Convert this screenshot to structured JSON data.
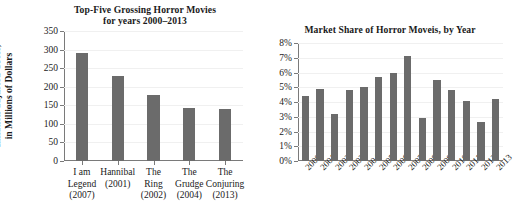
{
  "figure": {
    "background": "#ffffff",
    "bar_color": "#6b6b6b",
    "axis_color": "#7a7a7a",
    "grid_color": "#f0f0f0"
  },
  "chart_data": [
    {
      "type": "bar",
      "id": "top-five-grossing-horror-movies",
      "title": "Top-Five Grossing Horror Movies",
      "subtitle": "for years 2000–2013",
      "xlabel": "",
      "ylabel": "Inflation-adjusted Gross,",
      "ylabel_line2": "in Millions of Dollars",
      "categories": [
        "I am Legend (2007)",
        "Hannibal (2001)",
        "The Ring (2002)",
        "The Grudge (2004)",
        "The Conjuring (2013)"
      ],
      "category_lines": [
        [
          "I am",
          "Legend",
          "(2007)"
        ],
        [
          "Hannibal",
          "(2001)"
        ],
        [
          "The",
          "Ring",
          "(2002)"
        ],
        [
          "The",
          "Grudge",
          "(2004)"
        ],
        [
          "The",
          "Conjuring",
          "(2013)"
        ]
      ],
      "values": [
        291,
        228,
        177,
        143,
        139
      ],
      "ylim": [
        0,
        350
      ],
      "yticks": [
        0,
        50,
        100,
        150,
        200,
        250,
        300,
        350
      ],
      "ytick_labels": [
        "0",
        "50",
        "100",
        "150",
        "200",
        "250",
        "300",
        "350"
      ],
      "grid": true,
      "legend": "none"
    },
    {
      "type": "bar",
      "id": "market-share-of-horror-movies-by-year",
      "title": "Market Share of Horror Moveis, by Year",
      "subtitle": "",
      "xlabel": "",
      "ylabel": "",
      "categories": [
        "2000",
        "2001",
        "2002",
        "2003",
        "2004",
        "2005",
        "2006",
        "2007",
        "2008",
        "2009",
        "2010",
        "2011",
        "2012",
        "2013"
      ],
      "values": [
        4.4,
        4.85,
        3.2,
        4.8,
        5.05,
        5.7,
        6.0,
        7.15,
        2.95,
        5.5,
        4.8,
        4.05,
        2.65,
        4.2
      ],
      "ylim": [
        0,
        8
      ],
      "yticks": [
        0,
        1,
        2,
        3,
        4,
        5,
        6,
        7,
        8
      ],
      "ytick_labels": [
        "0%",
        "1%",
        "2%",
        "3%",
        "4%",
        "5%",
        "6%",
        "7%",
        "8%"
      ],
      "grid": true,
      "legend": "none"
    }
  ]
}
